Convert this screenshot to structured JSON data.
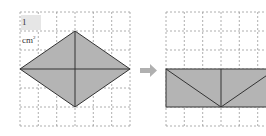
{
  "diagram": {
    "unit_label": "1 cm",
    "unit_sup": "2",
    "colors": {
      "fill": "#b4b4b4",
      "stroke": "#333333",
      "grid": "#9a9a9a",
      "arrow": "#b0b0b0"
    },
    "left_figure": {
      "shape": "rhombus",
      "diagonals": [
        "horizontal",
        "vertical"
      ],
      "grid": "6x6"
    },
    "arrow": "right-arrow",
    "right_figure": {
      "shape": "rectangle rearranged from rhombus triangles",
      "grid": "6x6 (partially visible)"
    }
  }
}
